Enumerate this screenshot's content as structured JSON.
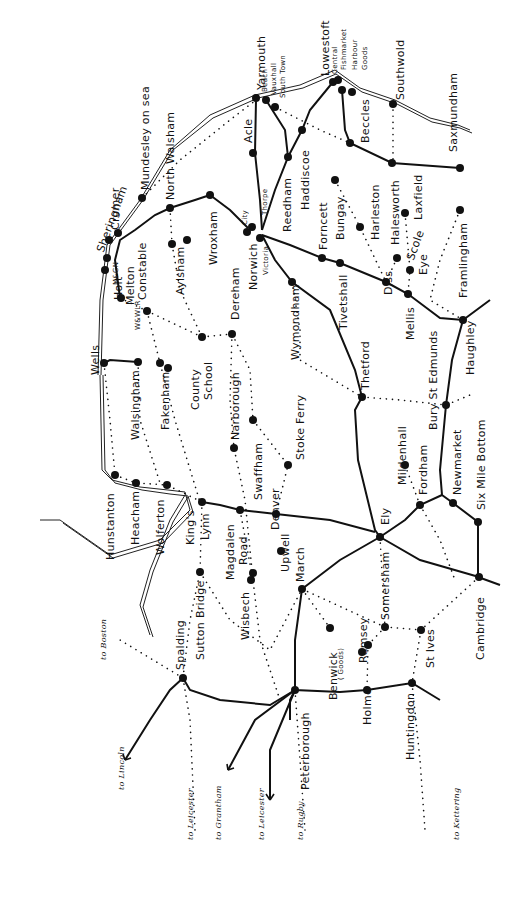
{
  "map": {
    "title": "Railways of East Anglia",
    "colors": {
      "ink": "#111111",
      "background": "#ffffff"
    },
    "legend_conventions": {
      "solid_line": "open line",
      "dotted_line": "closed line",
      "dot": "station"
    },
    "stations": [
      {
        "id": "yarmouth",
        "label": "Yarmouth",
        "x": 258,
        "y": 100,
        "lx": 256,
        "ly": 90
      },
      {
        "id": "beach",
        "label": "Beach",
        "x": 256,
        "y": 98,
        "lx": 262,
        "ly": 92,
        "size": "sm"
      },
      {
        "id": "vauxhall",
        "label": "Vauxhall",
        "x": 266,
        "y": 100,
        "lx": 271,
        "ly": 95,
        "size": "sm"
      },
      {
        "id": "south-town",
        "label": "South Town",
        "x": 275,
        "y": 107,
        "lx": 280,
        "ly": 98,
        "size": "sm"
      },
      {
        "id": "lowestoft",
        "label": "Lowestoft",
        "x": 333,
        "y": 82,
        "lx": 320,
        "ly": 76
      },
      {
        "id": "central",
        "label": "Central",
        "x": 338,
        "y": 80,
        "lx": 332,
        "ly": 74,
        "size": "sm"
      },
      {
        "id": "fishmarket",
        "label": "Fishmarket",
        "x": 342,
        "y": 90,
        "lx": 341,
        "ly": 70,
        "size": "sm"
      },
      {
        "id": "harbour",
        "label": "Harbour",
        "x": 350,
        "y": 92,
        "lx": 352,
        "ly": 70,
        "size": "sm"
      },
      {
        "id": "goods",
        "label": "Goods",
        "x": 352,
        "y": 92,
        "lx": 362,
        "ly": 70,
        "size": "sm"
      },
      {
        "id": "southwold",
        "label": "Southwold",
        "x": 393,
        "y": 104,
        "lx": 395,
        "ly": 100
      },
      {
        "id": "beccles",
        "label": "Beccles",
        "x": 350,
        "y": 143,
        "lx": 360,
        "ly": 143
      },
      {
        "id": "saxmundham",
        "label": "Saxmundham",
        "x": 460,
        "y": 168,
        "lx": 448,
        "ly": 152
      },
      {
        "id": "acle",
        "label": "Acle",
        "x": 253,
        "y": 153,
        "lx": 243,
        "ly": 143
      },
      {
        "id": "reedham",
        "label": "Reedham",
        "x": 288,
        "y": 157,
        "lx": 282,
        "ly": 232
      },
      {
        "id": "haddiscoe",
        "label": "Haddiscoe",
        "x": 302,
        "y": 130,
        "lx": 300,
        "ly": 210
      },
      {
        "id": "bungay",
        "label": "Bungay",
        "x": 335,
        "y": 180,
        "lx": 335,
        "ly": 240
      },
      {
        "id": "halesworth",
        "label": "Halesworth",
        "x": 392,
        "y": 163,
        "lx": 390,
        "ly": 245
      },
      {
        "id": "laxfield",
        "label": "Laxfield",
        "x": 405,
        "y": 213,
        "lx": 413,
        "ly": 220
      },
      {
        "id": "harleston",
        "label": "Harleston",
        "x": 360,
        "y": 227,
        "lx": 370,
        "ly": 240
      },
      {
        "id": "framlingham",
        "label": "Framlingham",
        "x": 460,
        "y": 210,
        "lx": 458,
        "ly": 298
      },
      {
        "id": "forncett",
        "label": "Forncett",
        "x": 322,
        "y": 258,
        "lx": 318,
        "ly": 250
      },
      {
        "id": "scole",
        "label": "Scole",
        "x": 397,
        "y": 258,
        "lx": 405,
        "ly": 258,
        "style": "tilt"
      },
      {
        "id": "eye",
        "label": "Eye",
        "x": 410,
        "y": 270,
        "lx": 418,
        "ly": 275
      },
      {
        "id": "tivetshall",
        "label": "Tivetshall",
        "x": 340,
        "y": 263,
        "lx": 338,
        "ly": 330
      },
      {
        "id": "diss",
        "label": "Diss",
        "x": 386,
        "y": 282,
        "lx": 383,
        "ly": 295
      },
      {
        "id": "mellis",
        "label": "Mellis",
        "x": 408,
        "y": 294,
        "lx": 405,
        "ly": 340
      },
      {
        "id": "haughley",
        "label": "Haughley",
        "x": 463,
        "y": 320,
        "lx": 465,
        "ly": 375
      },
      {
        "id": "norwich",
        "label": "Norwich",
        "x": 247,
        "y": 232,
        "lx": 248,
        "ly": 290
      },
      {
        "id": "city",
        "label": "City",
        "x": 248,
        "y": 229,
        "lx": 242,
        "ly": 225,
        "size": "sm"
      },
      {
        "id": "thorpe",
        "label": "Thorpe",
        "x": 257,
        "y": 225,
        "lx": 262,
        "ly": 215,
        "size": "sm"
      },
      {
        "id": "victoria",
        "label": "Victoria",
        "x": 260,
        "y": 238,
        "lx": 263,
        "ly": 275,
        "size": "sm"
      },
      {
        "id": "wymondham",
        "label": "Wymondham",
        "x": 292,
        "y": 282,
        "lx": 290,
        "ly": 360
      },
      {
        "id": "thetford",
        "label": "Thetford",
        "x": 362,
        "y": 397,
        "lx": 360,
        "ly": 390
      },
      {
        "id": "bury-st-edmunds",
        "label": "Bury St Edmunds",
        "x": 446,
        "y": 405,
        "lx": 428,
        "ly": 430
      },
      {
        "id": "mildenhall",
        "label": "Mildenhall",
        "x": 405,
        "y": 465,
        "lx": 397,
        "ly": 485
      },
      {
        "id": "fordham",
        "label": "Fordham",
        "x": 420,
        "y": 505,
        "lx": 418,
        "ly": 495
      },
      {
        "id": "newmarket",
        "label": "Newmarket",
        "x": 453,
        "y": 503,
        "lx": 452,
        "ly": 495
      },
      {
        "id": "six-mile-bottom",
        "label": "Six Mile Bottom",
        "x": 478,
        "y": 522,
        "lx": 476,
        "ly": 510
      },
      {
        "id": "ely",
        "label": "Ely",
        "x": 380,
        "y": 537,
        "lx": 380,
        "ly": 525
      },
      {
        "id": "cambridge",
        "label": "Cambridge",
        "x": 479,
        "y": 577,
        "lx": 475,
        "ly": 660
      },
      {
        "id": "st-ives",
        "label": "St Ives",
        "x": 421,
        "y": 630,
        "lx": 425,
        "ly": 668
      },
      {
        "id": "somersham",
        "label": "Somersham",
        "x": 385,
        "y": 627,
        "lx": 380,
        "ly": 620
      },
      {
        "id": "ramsey",
        "label": "Ramsey",
        "x": 368,
        "y": 645,
        "lx": 358,
        "ly": 663
      },
      {
        "id": "benwick",
        "label": "Benwick",
        "x": 330,
        "y": 628,
        "lx": 328,
        "ly": 700
      },
      {
        "id": "benwick-goods",
        "label": "( Goods)",
        "x": 330,
        "y": 628,
        "lx": 338,
        "ly": 680,
        "size": "sm"
      },
      {
        "id": "holme",
        "label": "Holme",
        "x": 367,
        "y": 690,
        "lx": 362,
        "ly": 725
      },
      {
        "id": "huntingdon",
        "label": "Huntingdon",
        "x": 412,
        "y": 683,
        "lx": 405,
        "ly": 760
      },
      {
        "id": "march",
        "label": "March",
        "x": 302,
        "y": 589,
        "lx": 295,
        "ly": 582
      },
      {
        "id": "upwell",
        "label": "Upwell",
        "x": 281,
        "y": 551,
        "lx": 280,
        "ly": 572
      },
      {
        "id": "peterborough",
        "label": "Peterborough",
        "x": 295,
        "y": 690,
        "lx": 300,
        "ly": 790
      },
      {
        "id": "denver",
        "label": "Denver",
        "x": 276,
        "y": 514,
        "lx": 270,
        "ly": 530
      },
      {
        "id": "stoke-ferry",
        "label": "Stoke Ferry",
        "x": 288,
        "y": 465,
        "lx": 295,
        "ly": 460
      },
      {
        "id": "swaffham",
        "label": "Swaffham",
        "x": 253,
        "y": 420,
        "lx": 253,
        "ly": 500
      },
      {
        "id": "narborough",
        "label": "Narborough",
        "x": 234,
        "y": 448,
        "lx": 230,
        "ly": 440
      },
      {
        "id": "dereham",
        "label": "Dereham",
        "x": 232,
        "y": 334,
        "lx": 230,
        "ly": 320
      },
      {
        "id": "county-school",
        "label": "County",
        "x": 202,
        "y": 337,
        "lx": 190,
        "ly": 410
      },
      {
        "id": "county-school-2",
        "label": "School",
        "x": 202,
        "y": 337,
        "lx": 203,
        "ly": 400
      },
      {
        "id": "fakenham",
        "label": "Fakenham",
        "x": 160,
        "y": 363,
        "lx": 160,
        "ly": 430
      },
      {
        "id": "walsingham",
        "label": "Walsingham",
        "x": 138,
        "y": 362,
        "lx": 130,
        "ly": 440
      },
      {
        "id": "wells",
        "label": "Wells",
        "x": 104,
        "y": 363,
        "lx": 90,
        "ly": 375
      },
      {
        "id": "holt",
        "label": "Holt",
        "x": 121,
        "y": 298,
        "lx": 113,
        "ly": 300
      },
      {
        "id": "melton-constable",
        "label": "Melton",
        "x": 147,
        "y": 311,
        "lx": 125,
        "ly": 305
      },
      {
        "id": "melton-constable-2",
        "label": "Constable",
        "x": 147,
        "y": 311,
        "lx": 137,
        "ly": 300
      },
      {
        "id": "aylsham",
        "label": "Aylsham",
        "x": 172,
        "y": 244,
        "lx": 175,
        "ly": 295
      },
      {
        "id": "wroxham",
        "label": "Wroxham",
        "x": 210,
        "y": 195,
        "lx": 208,
        "ly": 265
      },
      {
        "id": "north-walsham",
        "label": "North Walsham",
        "x": 170,
        "y": 208,
        "lx": 165,
        "ly": 200
      },
      {
        "id": "mundesley",
        "label": "Mundesley on sea",
        "x": 142,
        "y": 198,
        "lx": 140,
        "ly": 190
      },
      {
        "id": "cromer",
        "label": "Cromer",
        "x": 118,
        "y": 233,
        "lx": 110,
        "ly": 230
      },
      {
        "id": "sheringham",
        "label": "Sheringham",
        "x": 107,
        "y": 243,
        "lx": 95,
        "ly": 250,
        "style": "tilt"
      },
      {
        "id": "hunstanton",
        "label": "Hunstanton",
        "x": 115,
        "y": 475,
        "lx": 105,
        "ly": 560
      },
      {
        "id": "heacham",
        "label": "Heacham",
        "x": 136,
        "y": 483,
        "lx": 130,
        "ly": 545
      },
      {
        "id": "wolferton",
        "label": "Wolferton",
        "x": 167,
        "y": 485,
        "lx": 155,
        "ly": 555
      },
      {
        "id": "kings-lynn",
        "label": "King's",
        "x": 202,
        "y": 502,
        "lx": 185,
        "ly": 545
      },
      {
        "id": "kings-lynn-2",
        "label": "Lynn",
        "x": 202,
        "y": 502,
        "lx": 200,
        "ly": 540
      },
      {
        "id": "magdalen-road",
        "label": "Magdalen",
        "x": 240,
        "y": 510,
        "lx": 225,
        "ly": 580
      },
      {
        "id": "magdalen-road-2",
        "label": "Road",
        "x": 240,
        "y": 510,
        "lx": 238,
        "ly": 565
      },
      {
        "id": "sutton-bridge",
        "label": "Sutton Bridge",
        "x": 200,
        "y": 572,
        "lx": 195,
        "ly": 660
      },
      {
        "id": "wisbech",
        "label": "Wisbech",
        "x": 253,
        "y": 580,
        "lx": 240,
        "ly": 640
      },
      {
        "id": "spalding",
        "label": "Spalding",
        "x": 183,
        "y": 678,
        "lx": 175,
        "ly": 670
      }
    ],
    "destinations": [
      {
        "label": "to Boston",
        "lx": 100,
        "ly": 660
      },
      {
        "label": "to Lincoln",
        "lx": 118,
        "ly": 790
      },
      {
        "label": "to Leicester",
        "lx": 187,
        "ly": 840
      },
      {
        "label": "to Grantham",
        "lx": 215,
        "ly": 840
      },
      {
        "label": "to Leicester",
        "lx": 258,
        "ly": 840
      },
      {
        "label": "to Rugby",
        "lx": 297,
        "ly": 840
      },
      {
        "label": "to Kettering",
        "lx": 453,
        "ly": 840
      }
    ],
    "annotations": [
      {
        "label": "M&GN",
        "lx": 113,
        "ly": 285,
        "note": "(partially illegible)"
      },
      {
        "label": "W&WLR",
        "lx": 135,
        "ly": 330
      }
    ]
  }
}
